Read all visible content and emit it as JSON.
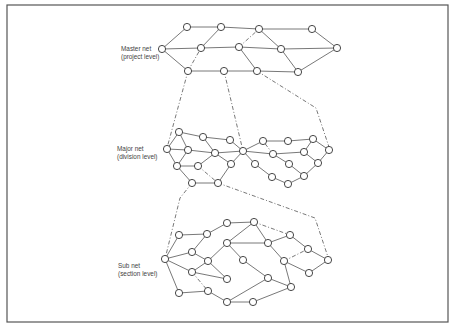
{
  "labels": {
    "master": {
      "line1": "Master net",
      "line2": "(project level)"
    },
    "major": {
      "line1": "Major net",
      "line2": "(division level)"
    },
    "sub": {
      "line1": "Sub net",
      "line2": "(section level)"
    }
  },
  "diagram": {
    "levels": [
      "Master net (project level)",
      "Major net (division level)",
      "Sub net (section level)"
    ],
    "colors": {
      "line": "#555555",
      "node_fill": "#ffffff",
      "node_stroke": "#333333"
    },
    "master_nodes": [
      [
        187,
        27
      ],
      [
        221,
        27
      ],
      [
        259,
        29
      ],
      [
        312,
        29
      ],
      [
        162,
        49
      ],
      [
        201,
        48
      ],
      [
        239,
        47
      ],
      [
        281,
        49
      ],
      [
        337,
        48
      ],
      [
        188,
        71
      ],
      [
        224,
        71
      ],
      [
        257,
        71
      ],
      [
        298,
        72
      ]
    ],
    "master_edges": [
      [
        0,
        1
      ],
      [
        1,
        2
      ],
      [
        2,
        3
      ],
      [
        3,
        8
      ],
      [
        4,
        0
      ],
      [
        4,
        5
      ],
      [
        5,
        1
      ],
      [
        5,
        6
      ],
      [
        6,
        7
      ],
      [
        2,
        7
      ],
      [
        7,
        8
      ],
      [
        7,
        12
      ],
      [
        12,
        8
      ],
      [
        4,
        9
      ],
      [
        9,
        10
      ],
      [
        10,
        11
      ],
      [
        11,
        12
      ],
      [
        6,
        11
      ]
    ],
    "master_dashed": [
      [
        6,
        2
      ],
      [
        9,
        5
      ]
    ],
    "major_nodes": [
      [
        179,
        132
      ],
      [
        203,
        137
      ],
      [
        230,
        140
      ],
      [
        167,
        149
      ],
      [
        188,
        150
      ],
      [
        215,
        153
      ],
      [
        177,
        166
      ],
      [
        198,
        166
      ],
      [
        231,
        164
      ],
      [
        192,
        183
      ],
      [
        218,
        183
      ],
      [
        243,
        151
      ],
      [
        263,
        141
      ],
      [
        288,
        141
      ],
      [
        313,
        139
      ],
      [
        329,
        150
      ],
      [
        273,
        154
      ],
      [
        304,
        152
      ],
      [
        255,
        164
      ],
      [
        289,
        164
      ],
      [
        318,
        163
      ],
      [
        272,
        177
      ],
      [
        304,
        176
      ],
      [
        288,
        184
      ]
    ],
    "major_edges": [
      [
        0,
        1
      ],
      [
        1,
        2
      ],
      [
        2,
        11
      ],
      [
        0,
        3
      ],
      [
        0,
        4
      ],
      [
        3,
        4
      ],
      [
        3,
        6
      ],
      [
        4,
        6
      ],
      [
        4,
        5
      ],
      [
        5,
        1
      ],
      [
        5,
        11
      ],
      [
        5,
        8
      ],
      [
        8,
        11
      ],
      [
        6,
        7
      ],
      [
        7,
        5
      ],
      [
        6,
        9
      ],
      [
        9,
        10
      ],
      [
        8,
        10
      ],
      [
        11,
        12
      ],
      [
        12,
        13
      ],
      [
        13,
        14
      ],
      [
        14,
        15
      ],
      [
        11,
        16
      ],
      [
        11,
        18
      ],
      [
        16,
        17
      ],
      [
        17,
        14
      ],
      [
        16,
        19
      ],
      [
        18,
        21
      ],
      [
        21,
        23
      ],
      [
        23,
        22
      ],
      [
        22,
        20
      ],
      [
        20,
        15
      ],
      [
        19,
        22
      ],
      [
        17,
        20
      ]
    ],
    "major_dashed": [
      [
        7,
        10
      ],
      [
        16,
        12
      ]
    ],
    "sub_nodes": [
      [
        165,
        259
      ],
      [
        179,
        235
      ],
      [
        207,
        234
      ],
      [
        227,
        223
      ],
      [
        192,
        252
      ],
      [
        208,
        261
      ],
      [
        227,
        243
      ],
      [
        192,
        272
      ],
      [
        227,
        279
      ],
      [
        179,
        293
      ],
      [
        208,
        291
      ],
      [
        227,
        302
      ],
      [
        254,
        222
      ],
      [
        290,
        235
      ],
      [
        308,
        249
      ],
      [
        328,
        260
      ],
      [
        268,
        243
      ],
      [
        243,
        260
      ],
      [
        284,
        261
      ],
      [
        268,
        278
      ],
      [
        309,
        273
      ],
      [
        291,
        287
      ],
      [
        253,
        302
      ]
    ],
    "sub_edges": [
      [
        0,
        1
      ],
      [
        0,
        4
      ],
      [
        0,
        7
      ],
      [
        0,
        9
      ],
      [
        1,
        2
      ],
      [
        2,
        3
      ],
      [
        2,
        4
      ],
      [
        4,
        5
      ],
      [
        5,
        6
      ],
      [
        7,
        8
      ],
      [
        9,
        10
      ],
      [
        10,
        11
      ],
      [
        3,
        12
      ],
      [
        12,
        6
      ],
      [
        12,
        16
      ],
      [
        6,
        16
      ],
      [
        16,
        13
      ],
      [
        13,
        14
      ],
      [
        14,
        15
      ],
      [
        16,
        18
      ],
      [
        18,
        20
      ],
      [
        20,
        15
      ],
      [
        18,
        21
      ],
      [
        6,
        17
      ],
      [
        17,
        19
      ],
      [
        19,
        21
      ],
      [
        11,
        22
      ],
      [
        22,
        21
      ],
      [
        11,
        19
      ],
      [
        5,
        8
      ],
      [
        7,
        5
      ]
    ],
    "sub_dashed": [
      [
        7,
        10
      ],
      [
        12,
        13
      ],
      [
        18,
        14
      ]
    ],
    "connectors": [
      [
        [
          188,
          71
        ],
        [
          167,
          148
        ]
      ],
      [
        [
          224,
          71
        ],
        [
          243,
          151
        ]
      ],
      [
        [
          257,
          71
        ],
        [
          316,
          108
        ],
        [
          330,
          150
        ]
      ],
      [
        [
          192,
          183
        ],
        [
          180,
          198
        ],
        [
          165,
          259
        ]
      ],
      [
        [
          218,
          183
        ],
        [
          315,
          218
        ],
        [
          329,
          260
        ]
      ]
    ]
  }
}
